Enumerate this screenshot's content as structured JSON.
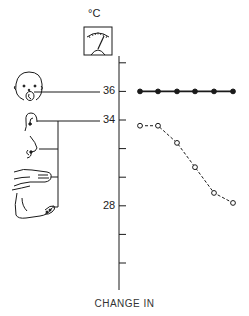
{
  "figure": {
    "unit_label": "°C",
    "caption": "CHANGE IN",
    "icons": [
      "thermometer-gauge-icon",
      "face-mouth-icon",
      "ear-icon",
      "nose-icon",
      "hand-icon",
      "foot-icon"
    ],
    "body_sites": [
      "mouth",
      "ear",
      "nose",
      "hand",
      "foot"
    ]
  },
  "axis": {
    "tick_values": [
      38,
      36,
      34,
      32,
      30,
      28,
      26,
      24
    ],
    "labels": [
      {
        "value": 36,
        "text": "36"
      },
      {
        "value": 34,
        "text": "34"
      },
      {
        "value": 28,
        "text": "28"
      }
    ]
  },
  "chart_data": {
    "type": "line",
    "title": "",
    "xlabel": "CHANGE IN",
    "ylabel": "°C",
    "ylim": [
      23,
      39
    ],
    "grid": false,
    "legend": null,
    "x": [
      1,
      2,
      3,
      4,
      5,
      6
    ],
    "series": [
      {
        "name": "Core (mouth)",
        "style": "solid, filled markers",
        "values": [
          36,
          36,
          36,
          36,
          36,
          36
        ]
      },
      {
        "name": "Periphery (ear, nose, hand, foot)",
        "style": "dashed, open markers",
        "values": [
          33.6,
          33.6,
          32.4,
          30.7,
          28.9,
          28.2
        ]
      }
    ],
    "annotations": [
      {
        "text": "mouth → 36"
      },
      {
        "text": "ear, nose, hand, foot → 34"
      }
    ]
  },
  "colors": {
    "ink": "#1a1a1a",
    "background": "#ffffff"
  }
}
